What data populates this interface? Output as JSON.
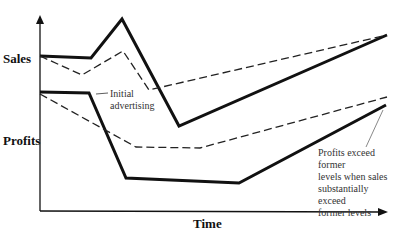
{
  "labels": {
    "sales": "Sales",
    "profits": "Profits",
    "xaxis": "Time",
    "annotation_initial": [
      "Initial",
      "advertising"
    ],
    "annotation_profits": [
      "Profits exceed former",
      "levels when sales",
      "substantially exceed",
      "former levels"
    ]
  },
  "chart_data": {
    "type": "line",
    "title": "",
    "xlabel": "Time",
    "ylabel": "",
    "y_category_labels": [
      "Sales",
      "Profits"
    ],
    "series": [
      {
        "name": "Sales (solid)",
        "style": "solid",
        "points": [
          [
            40,
            56
          ],
          [
            91,
            58
          ],
          [
            122,
            19
          ],
          [
            179,
            126
          ],
          [
            387,
            35
          ]
        ]
      },
      {
        "name": "Sales (dashed)",
        "style": "dashed",
        "points": [
          [
            40,
            56
          ],
          [
            82,
            75
          ],
          [
            123,
            51
          ],
          [
            149,
            90
          ],
          [
            387,
            35
          ]
        ]
      },
      {
        "name": "Profits (solid)",
        "style": "solid",
        "points": [
          [
            40,
            92
          ],
          [
            89,
            93
          ],
          [
            126,
            178
          ],
          [
            239,
            183
          ],
          [
            386,
            105
          ]
        ]
      },
      {
        "name": "Profits (dashed)",
        "style": "dashed",
        "points": [
          [
            40,
            94
          ],
          [
            136,
            147
          ],
          [
            200,
            148
          ],
          [
            387,
            97
          ]
        ]
      }
    ],
    "annotations": [
      {
        "text": "Initial advertising",
        "leader_from": [
          110,
          96
        ],
        "leader_to": [
          96,
          93
        ]
      },
      {
        "text": "Profits exceed former levels when sales substantially exceed former levels",
        "leader_from": [
          366,
          148
        ],
        "leader_to": [
          383,
          108
        ]
      }
    ],
    "grid": false
  }
}
